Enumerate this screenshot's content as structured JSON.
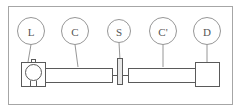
{
  "figure": {
    "background_color": "#ffffff",
    "frame": {
      "name": "figure-border",
      "stroke_color": "#a6a6a6",
      "x": 8,
      "y": 6,
      "width": 224,
      "height": 98
    },
    "line_color": "#5a5a5a",
    "label_color": "#8a8a8a",
    "text_color": "#555555"
  },
  "labels": [
    {
      "id": "L",
      "text": "L",
      "cx": 31,
      "cy": 31,
      "r": 13.5,
      "leader_x2": 28,
      "leader_y2": 62
    },
    {
      "id": "C",
      "text": "C",
      "cx": 75,
      "cy": 31,
      "r": 13.5,
      "leader_x2": 78,
      "leader_y2": 67
    },
    {
      "id": "S",
      "text": "S",
      "cx": 119,
      "cy": 31,
      "r": 11.5,
      "leader_x2": 120,
      "leader_y2": 60
    },
    {
      "id": "Cp",
      "text": "C'",
      "cx": 163,
      "cy": 31,
      "r": 13.5,
      "leader_x2": 163,
      "leader_y2": 67
    },
    {
      "id": "D",
      "text": "D",
      "cx": 207,
      "cy": 31,
      "r": 13.5,
      "leader_x2": 207,
      "leader_y2": 62
    }
  ],
  "components": {
    "lamp": {
      "name": "lamp-source",
      "box": {
        "x": 21,
        "y": 62,
        "width": 24,
        "height": 24
      },
      "bulb": {
        "cx": 33,
        "cy": 72,
        "r": 8
      },
      "stem": {
        "x": 30,
        "y": 80,
        "width": 6,
        "height": 6
      },
      "top_tab": {
        "x": 31,
        "y": 59,
        "width": 4,
        "height": 3
      }
    },
    "collimator_left": {
      "name": "collimator-left",
      "tube": {
        "x": 45,
        "y": 68,
        "width": 67,
        "height": 14
      },
      "neck": {
        "x": 45,
        "y": 72,
        "width": 4,
        "height": 6
      }
    },
    "slit": {
      "name": "slit-sample",
      "plate": {
        "x": 117,
        "y": 58,
        "width": 5,
        "height": 26
      }
    },
    "collimator_right": {
      "name": "collimator-right",
      "tube": {
        "x": 128,
        "y": 68,
        "width": 67,
        "height": 14
      }
    },
    "detector": {
      "name": "detector",
      "box": {
        "x": 195,
        "y": 62,
        "width": 24,
        "height": 24
      }
    },
    "beam_axis": {
      "name": "optical-axis",
      "y": 75,
      "x_start": 45,
      "x_end": 195
    }
  },
  "diagram_meta": {
    "title": "",
    "caption": "",
    "type": "optical-bench-schematic"
  }
}
